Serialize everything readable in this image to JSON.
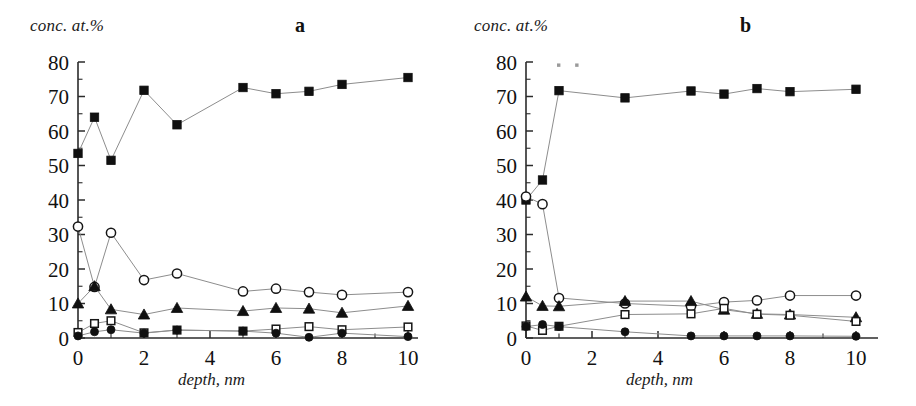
{
  "figure": {
    "background_color": "#ffffff",
    "line_color": "#8d8d8d",
    "marker_color": "#101010",
    "axis_color": "#2b2b2b"
  },
  "panels": [
    {
      "letter": "a",
      "ylabel": "conc. at.%",
      "xlabel": "depth, nm"
    },
    {
      "letter": "b",
      "ylabel": "conc. at.%",
      "xlabel": "depth, nm"
    }
  ],
  "chart_data": [
    {
      "type": "line",
      "title": "a",
      "xlabel": "depth, nm",
      "ylabel": "conc. at.%",
      "xlim": [
        0,
        10
      ],
      "ylim": [
        0,
        80
      ],
      "xticks": [
        0,
        2,
        4,
        6,
        8,
        10
      ],
      "yticks": [
        0,
        10,
        20,
        30,
        40,
        50,
        60,
        70,
        80
      ],
      "xtick_labels": [
        "0",
        "2",
        "4",
        "6",
        "8",
        "10"
      ],
      "ytick_labels": [
        "0",
        "10",
        "20",
        "30",
        "40",
        "50",
        "60",
        "70",
        "80"
      ],
      "grid": false,
      "legend": "none",
      "x": [
        0,
        0.5,
        1,
        2,
        3,
        5,
        6,
        7,
        8,
        10
      ],
      "series": [
        {
          "name": "filled-square",
          "marker": "filled-square",
          "values": [
            53.5,
            64.0,
            51.5,
            71.8,
            61.8,
            72.6,
            70.8,
            71.5,
            73.5,
            75.5
          ]
        },
        {
          "name": "open-circle",
          "marker": "open-circle",
          "values": [
            32.3,
            14.8,
            30.5,
            16.8,
            18.7,
            13.5,
            14.3,
            13.3,
            12.5,
            13.3
          ]
        },
        {
          "name": "filled-triangle",
          "marker": "filled-triangle",
          "values": [
            10.0,
            15.0,
            8.3,
            6.8,
            8.7,
            7.8,
            8.7,
            8.5,
            7.3,
            9.3
          ]
        },
        {
          "name": "open-square",
          "marker": "open-square",
          "values": [
            1.6,
            4.2,
            5.0,
            1.5,
            2.3,
            2.0,
            2.6,
            3.3,
            2.4,
            3.2
          ]
        },
        {
          "name": "filled-circle",
          "marker": "filled-circle",
          "values": [
            0.6,
            1.8,
            2.4,
            1.4,
            2.3,
            2.0,
            1.4,
            0.2,
            1.4,
            0.4
          ]
        }
      ]
    },
    {
      "type": "line",
      "title": "b",
      "xlabel": "depth, nm",
      "ylabel": "conc. at.%",
      "xlim": [
        0,
        10
      ],
      "ylim": [
        0,
        80
      ],
      "xticks": [
        0,
        2,
        4,
        6,
        8,
        10
      ],
      "yticks": [
        0,
        10,
        20,
        30,
        40,
        50,
        60,
        70,
        80
      ],
      "xtick_labels": [
        "0",
        "2",
        "4",
        "6",
        "8",
        "10"
      ],
      "ytick_labels": [
        "0",
        "10",
        "20",
        "30",
        "40",
        "50",
        "60",
        "70",
        "80"
      ],
      "grid": false,
      "legend": "none",
      "x": [
        0,
        0.5,
        1,
        3,
        5,
        6,
        7,
        8,
        10
      ],
      "series": [
        {
          "name": "filled-square",
          "marker": "filled-square",
          "values": [
            40.0,
            45.8,
            71.7,
            69.6,
            71.6,
            70.7,
            72.3,
            71.4,
            72.1
          ]
        },
        {
          "name": "open-circle",
          "marker": "open-circle",
          "values": [
            41.0,
            38.8,
            11.6,
            10.0,
            9.2,
            10.4,
            10.9,
            12.3,
            12.3
          ]
        },
        {
          "name": "filled-triangle",
          "marker": "filled-triangle",
          "values": [
            12.0,
            9.3,
            9.2,
            10.7,
            10.7,
            8.2,
            7.0,
            6.8,
            6.0
          ]
        },
        {
          "name": "open-square",
          "marker": "open-square",
          "values": [
            3.5,
            2.2,
            3.4,
            6.8,
            7.0,
            8.6,
            6.9,
            6.6,
            4.8
          ]
        },
        {
          "name": "filled-circle",
          "marker": "filled-circle",
          "values": [
            3.3,
            3.9,
            3.3,
            1.8,
            0.6,
            0.6,
            0.6,
            0.6,
            0.5
          ]
        }
      ],
      "artifacts": [
        {
          "x": 1.0,
          "y": 79.0
        },
        {
          "x": 1.55,
          "y": 79.0
        }
      ]
    }
  ]
}
